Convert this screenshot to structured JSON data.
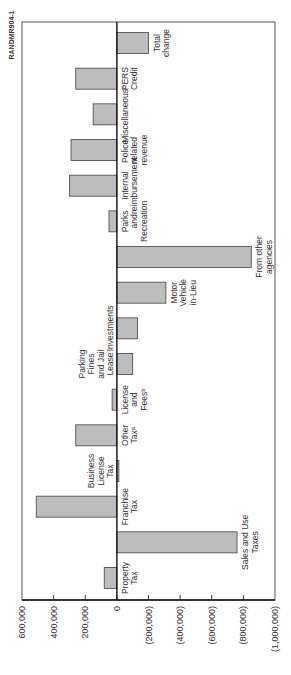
{
  "figure_code": "RANDMR904-1",
  "chart_data": {
    "type": "bar",
    "orientation": "vertical, figure rotated 90° counter-clockwise on page",
    "title": "",
    "xlabel": "",
    "ylabel": "",
    "ylim": [
      -1000000,
      600000
    ],
    "yticks": [
      600000,
      400000,
      200000,
      0,
      -200000,
      -400000,
      -600000,
      -800000,
      -1000000
    ],
    "ytick_labels": [
      "600,000",
      "400,000",
      "200,000",
      "0",
      "(200,000)",
      "(400,000)",
      "(600,000)",
      "(800,000)",
      "(1,000,000)"
    ],
    "grid": false,
    "legend": null,
    "categories": [
      "Property Tax",
      "Sales and Use Taxes",
      "Franchise Tax",
      "Business License Tax",
      "Other Tax^a",
      "License and Fees^b",
      "Parking Fines and Jail Lease",
      "Investments",
      "Motor Vehicle in-Lieu",
      "From other agencies",
      "Parks and Recreation",
      "Internal reimbursement",
      "Police-related revenue",
      "Miscellaneous^c",
      "PERS Credit",
      "Total change"
    ],
    "values": [
      80000,
      -760000,
      510000,
      -5000,
      260000,
      30000,
      -100000,
      -130000,
      -310000,
      -850000,
      50000,
      300000,
      290000,
      150000,
      260000,
      -200000
    ]
  },
  "bars": [
    {
      "label_lines": [
        "Property",
        "Tax"
      ],
      "value": 80000
    },
    {
      "label_lines": [
        "Sales and Use",
        "Taxes"
      ],
      "value": -760000
    },
    {
      "label_lines": [
        "Franchise",
        "Tax"
      ],
      "value": 510000
    },
    {
      "label_lines": [
        "Business",
        "License",
        "Tax"
      ],
      "value": -5000
    },
    {
      "label_lines": [
        "Other",
        "Taxᵃ"
      ],
      "value": 260000
    },
    {
      "label_lines": [
        "License",
        "and",
        "Feesᵇ"
      ],
      "value": 30000
    },
    {
      "label_lines": [
        "Parking",
        "Fines",
        "and Jail",
        "Lease"
      ],
      "value": -100000
    },
    {
      "label_lines": [
        "Investments"
      ],
      "value": -130000
    },
    {
      "label_lines": [
        "Motor",
        "Vehicle",
        "in-Lieu"
      ],
      "value": -310000
    },
    {
      "label_lines": [
        "From other",
        "agencies"
      ],
      "value": -850000
    },
    {
      "label_lines": [
        "Parks",
        "and",
        "Recreation"
      ],
      "value": 50000
    },
    {
      "label_lines": [
        "Internal",
        "reimbursement"
      ],
      "value": 300000
    },
    {
      "label_lines": [
        "Police-",
        "related",
        "revenue"
      ],
      "value": 290000
    },
    {
      "label_lines": [
        "Miscellaneousᶜ"
      ],
      "value": 150000
    },
    {
      "label_lines": [
        "PERS",
        "Credit"
      ],
      "value": 260000
    },
    {
      "label_lines": [
        "Total",
        "change"
      ],
      "value": -200000
    }
  ],
  "colors": {
    "bar_fill": "#bdbdbd",
    "bar_stroke": "#444444",
    "axis": "#111111",
    "frame": "#555555",
    "text": "#333333"
  }
}
